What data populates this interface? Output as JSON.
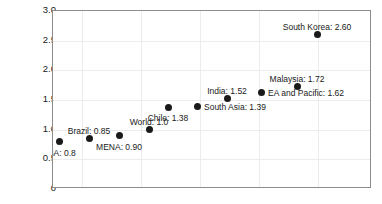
{
  "chart_data": {
    "type": "scatter",
    "title": "",
    "xlabel": "",
    "ylabel": "",
    "ylim": [
      0,
      3.0
    ],
    "ytick_labels": [
      "3.0",
      "2.5",
      "2.0",
      "1.5",
      "1.0",
      "0.5",
      "0"
    ],
    "ytick_values": [
      3.0,
      2.5,
      2.0,
      1.5,
      1.0,
      0.5,
      0
    ],
    "xtick_labels": [],
    "grid": true,
    "legend": "none",
    "marker_color": "#1a1a1a",
    "axis_color": "#8c8c8c",
    "grid_color": "#ececec",
    "points": [
      {
        "name": "SSA",
        "label": "SSA: 0.8",
        "value": 0.8,
        "x_px": 58,
        "y_value": 0.8,
        "label_pos": "below"
      },
      {
        "name": "Brazil",
        "label": "Brazil: 0.85",
        "value": 0.85,
        "x_px": 88,
        "y_value": 0.85,
        "label_pos": "above"
      },
      {
        "name": "MENA",
        "label": "MENA: 0.90",
        "value": 0.9,
        "x_px": 118,
        "y_value": 0.9,
        "label_pos": "below"
      },
      {
        "name": "World",
        "label": "World: 1.0",
        "value": 1.0,
        "x_px": 148,
        "y_value": 1.0,
        "label_pos": "above"
      },
      {
        "name": "Chile",
        "label": "Chile: 1.38",
        "value": 1.38,
        "x_px": 167,
        "y_value": 1.38,
        "label_pos": "below"
      },
      {
        "name": "South Asia",
        "label": "South Asia: 1.39",
        "value": 1.39,
        "x_px": 196,
        "y_value": 1.39,
        "label_pos": "right"
      },
      {
        "name": "India",
        "label": "India: 1.52",
        "value": 1.52,
        "x_px": 226,
        "y_value": 1.52,
        "label_pos": "above"
      },
      {
        "name": "EA and Pacific",
        "label": "EA and Pacific: 1.62",
        "value": 1.62,
        "x_px": 260,
        "y_value": 1.62,
        "label_pos": "right"
      },
      {
        "name": "Malaysia",
        "label": "Malaysia: 1.72",
        "value": 1.72,
        "x_px": 296,
        "y_value": 1.72,
        "label_pos": "above"
      },
      {
        "name": "South Korea",
        "label": "South Korea: 2.60",
        "value": 2.6,
        "x_px": 316,
        "y_value": 2.6,
        "label_pos": "above"
      }
    ],
    "vertical_gridlines_px": [
      81,
      140,
      199,
      258,
      317
    ]
  }
}
